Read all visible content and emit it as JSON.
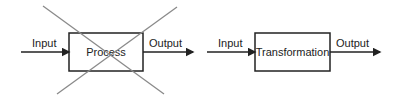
{
  "diagrams": [
    {
      "id": "crossed-out",
      "input_label": "Input",
      "box_label": "Process",
      "output_label": "Output",
      "crossed_out": true
    },
    {
      "id": "preferred",
      "input_label": "Input",
      "box_label": "Transformation",
      "output_label": "Output",
      "crossed_out": false
    }
  ],
  "colors": {
    "line": "#222222",
    "cross": "#8a8a8a"
  }
}
